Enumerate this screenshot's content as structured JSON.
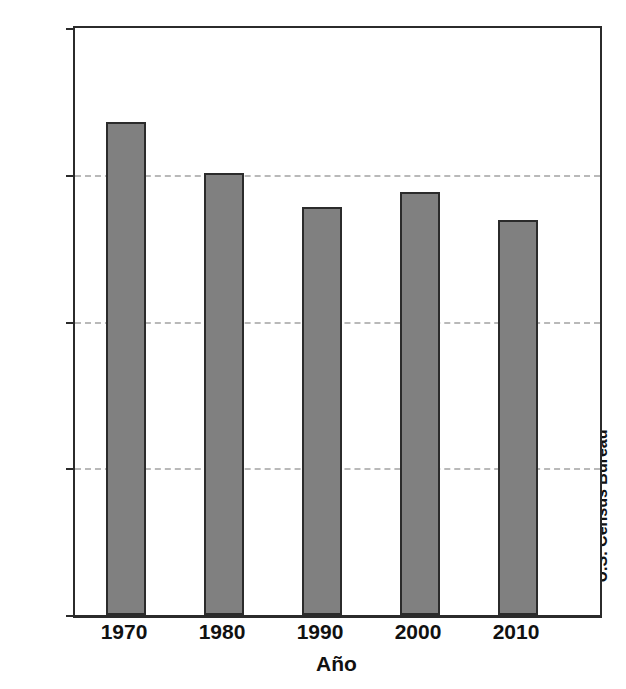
{
  "chart_data": {
    "type": "bar",
    "title": "",
    "xlabel": "Año",
    "ylabel": "Población (en millones)",
    "categories": [
      "1970",
      "1980",
      "1990",
      "2000",
      "2010"
    ],
    "values": [
      3.36,
      3.01,
      2.78,
      2.88,
      2.69
    ],
    "ylim": [
      0,
      4
    ],
    "yticks": [
      "0",
      "1",
      "2",
      "3",
      "4"
    ],
    "ytick_values": [
      0,
      1,
      2,
      3,
      4
    ],
    "gridlines_at": [
      1,
      2,
      3
    ],
    "grid": true,
    "legend": "none",
    "annotations": {
      "source": "U.S. Census Bureau"
    },
    "colors": {
      "bar_fill": "#808080",
      "bar_edge": "#2b2b2b",
      "axis": "#2b2b2b",
      "grid": "#b9b9b9",
      "text": "#111111",
      "background": "#ffffff"
    }
  }
}
